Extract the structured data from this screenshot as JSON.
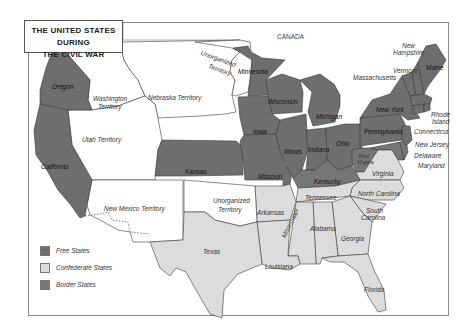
{
  "title": {
    "line1": "THE UNITED STATES DURING",
    "line2": "THE CIVIL WAR"
  },
  "colors": {
    "free": "#6e6e6e",
    "confederate": "#dcdcdc",
    "border": "#767676",
    "territory": "#ffffff",
    "outline": "#3a3a3a"
  },
  "neighbors": {
    "canada": "CANADA"
  },
  "labels": {
    "oregon": "Oregon",
    "california": "California",
    "washington_territory_1": "Washington",
    "washington_territory_2": "Territory",
    "nebraska_territory": "Nebraska Territory",
    "utah_territory": "Utah Territory",
    "new_mexico_territory": "New Mexico Territory",
    "unorganized_north_1": "Unorganized",
    "unorganized_north_2": "Territory",
    "unorganized_south_1": "Unorganized",
    "unorganized_south_2": "Territory",
    "minnesota": "Minnesota",
    "wisconsin": "Wisconsin",
    "michigan": "Michigan",
    "iowa": "Iowa",
    "illinois": "Illinois",
    "indiana": "Indiana",
    "ohio": "Ohio",
    "kansas": "Kansas",
    "missouri": "Missouri",
    "kentucky": "Kentucky",
    "pennsylvania": "Pennsylvania",
    "new_york": "New York",
    "west_virginia_1": "West",
    "west_virginia_2": "Virginia",
    "maine": "Maine",
    "new_hampshire_1": "New",
    "new_hampshire_2": "Hampshire",
    "vermont": "Vermont",
    "massachusetts": "Massachusetts",
    "rhode_island_1": "Rhode",
    "rhode_island_2": "Island",
    "connecticut": "Connecticut",
    "new_jersey": "New Jersey",
    "delaware": "Delaware",
    "maryland": "Maryland",
    "virginia": "Virginia",
    "north_carolina": "North Carolina",
    "south_carolina_1": "South",
    "south_carolina_2": "Carolina",
    "tennessee": "Tennessee",
    "arkansas": "Arkansas",
    "texas": "Texas",
    "louisiana": "Louisiana",
    "mississippi": "Mississippi",
    "alabama": "Alabama",
    "georgia": "Georgia",
    "florida": "Florida"
  },
  "legend": [
    {
      "label": "Free States",
      "color": "#6e6e6e"
    },
    {
      "label": "Confederate States",
      "color": "#dcdcdc"
    },
    {
      "label": "Border States",
      "color": "#767676"
    }
  ]
}
